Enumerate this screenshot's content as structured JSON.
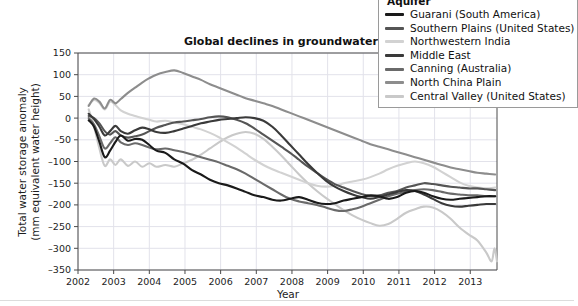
{
  "chart_data": {
    "type": "line",
    "title": "Global declines in groundwater",
    "xlabel": "Year",
    "ylabel_line1": "Total water storage anomaly",
    "ylabel_line2": "(mm equivalent water height)",
    "xlim": [
      2002.0,
      2013.75
    ],
    "ylim": [
      -350,
      150
    ],
    "ytick_step": 50,
    "yticks": [
      150,
      100,
      50,
      0,
      -50,
      -100,
      -150,
      -200,
      -250,
      -300,
      -350
    ],
    "xticks": [
      2002,
      2003,
      2004,
      2005,
      2006,
      2007,
      2008,
      2009,
      2010,
      2011,
      2012,
      2013
    ],
    "grid": true,
    "legend_position": "top-right",
    "legend_title": "Aquifer",
    "series": [
      {
        "name": "Guarani (South America)",
        "color": "#1a1a1a",
        "x": [
          2002.3,
          2002.45,
          2002.6,
          2002.75,
          2002.9,
          2003.05,
          2003.2,
          2003.4,
          2003.6,
          2003.8,
          2004.0,
          2004.2,
          2004.45,
          2004.7,
          2004.95,
          2005.2,
          2005.45,
          2005.7,
          2005.95,
          2006.2,
          2006.45,
          2006.7,
          2006.95,
          2007.2,
          2007.45,
          2007.7,
          2007.95,
          2008.2,
          2008.45,
          2008.7,
          2008.95,
          2009.2,
          2009.45,
          2009.7,
          2009.95,
          2010.2,
          2010.45,
          2010.7,
          2010.95,
          2011.2,
          2011.45,
          2011.7,
          2011.95,
          2012.2,
          2012.45,
          2012.7,
          2012.95,
          2013.2,
          2013.45,
          2013.7
        ],
        "y": [
          -5,
          -20,
          -55,
          -90,
          -75,
          -55,
          -40,
          -52,
          -48,
          -50,
          -62,
          -75,
          -80,
          -95,
          -105,
          -120,
          -130,
          -142,
          -150,
          -155,
          -162,
          -170,
          -178,
          -182,
          -188,
          -190,
          -186,
          -182,
          -188,
          -195,
          -198,
          -196,
          -190,
          -186,
          -182,
          -178,
          -180,
          -186,
          -182,
          -172,
          -168,
          -172,
          -180,
          -186,
          -188,
          -186,
          -184,
          -182,
          -180,
          -180
        ]
      },
      {
        "name": "Southern Plains (United States)",
        "color": "#555555",
        "x": [
          2002.3,
          2002.45,
          2002.6,
          2002.75,
          2002.9,
          2003.05,
          2003.2,
          2003.4,
          2003.6,
          2003.8,
          2004.0,
          2004.2,
          2004.45,
          2004.7,
          2004.95,
          2005.2,
          2005.45,
          2005.7,
          2005.95,
          2006.2,
          2006.45,
          2006.7,
          2006.95,
          2007.2,
          2007.45,
          2007.7,
          2007.95,
          2008.2,
          2008.45,
          2008.7,
          2008.95,
          2009.2,
          2009.45,
          2009.7,
          2009.95,
          2010.2,
          2010.45,
          2010.7,
          2010.95,
          2011.2,
          2011.45,
          2011.7,
          2011.95,
          2012.2,
          2012.45,
          2012.7,
          2012.95,
          2013.2,
          2013.45,
          2013.7
        ],
        "y": [
          5,
          0,
          -12,
          -30,
          -38,
          -30,
          -40,
          -45,
          -42,
          -38,
          -30,
          -22,
          -16,
          -10,
          -8,
          -5,
          -2,
          2,
          4,
          2,
          -4,
          -12,
          -24,
          -38,
          -52,
          -66,
          -80,
          -96,
          -112,
          -126,
          -140,
          -152,
          -160,
          -168,
          -175,
          -180,
          -178,
          -172,
          -168,
          -160,
          -155,
          -150,
          -152,
          -155,
          -158,
          -160,
          -162,
          -162,
          -164,
          -166
        ]
      },
      {
        "name": "Northwestern India",
        "color": "#d2d2d2",
        "x": [
          2002.3,
          2002.45,
          2002.6,
          2002.75,
          2002.9,
          2003.05,
          2003.2,
          2003.4,
          2003.6,
          2003.8,
          2004.0,
          2004.2,
          2004.45,
          2004.7,
          2004.95,
          2005.2,
          2005.45,
          2005.7,
          2005.95,
          2006.2,
          2006.45,
          2006.7,
          2006.95,
          2007.2,
          2007.45,
          2007.7,
          2007.95,
          2008.2,
          2008.45,
          2008.7,
          2008.95,
          2009.2,
          2009.45,
          2009.7,
          2009.95,
          2010.2,
          2010.45,
          2010.7,
          2010.95,
          2011.2,
          2011.45,
          2011.7,
          2011.95,
          2012.2,
          2012.45,
          2012.7,
          2012.95,
          2013.2,
          2013.45,
          2013.7
        ],
        "y": [
          30,
          42,
          35,
          20,
          38,
          30,
          18,
          10,
          5,
          0,
          -4,
          -8,
          -6,
          -10,
          -14,
          -20,
          -26,
          -34,
          -44,
          -56,
          -68,
          -82,
          -96,
          -108,
          -118,
          -126,
          -134,
          -142,
          -150,
          -156,
          -158,
          -156,
          -150,
          -146,
          -142,
          -136,
          -128,
          -118,
          -110,
          -104,
          -100,
          -104,
          -112,
          -124,
          -136,
          -148,
          -156,
          -160,
          -162,
          -160
        ]
      },
      {
        "name": "Middle East",
        "color": "#3a3a3a",
        "x": [
          2002.3,
          2002.45,
          2002.6,
          2002.75,
          2002.9,
          2003.05,
          2003.2,
          2003.4,
          2003.6,
          2003.8,
          2004.0,
          2004.2,
          2004.45,
          2004.7,
          2004.95,
          2005.2,
          2005.45,
          2005.7,
          2005.95,
          2006.2,
          2006.45,
          2006.7,
          2006.95,
          2007.2,
          2007.45,
          2007.7,
          2007.95,
          2008.2,
          2008.45,
          2008.7,
          2008.95,
          2009.2,
          2009.45,
          2009.7,
          2009.95,
          2010.2,
          2010.45,
          2010.7,
          2010.95,
          2011.2,
          2011.45,
          2011.7,
          2011.95,
          2012.2,
          2012.45,
          2012.7,
          2012.95,
          2013.2,
          2013.45,
          2013.7
        ],
        "y": [
          10,
          -2,
          -20,
          -40,
          -30,
          -18,
          -30,
          -36,
          -28,
          -22,
          -26,
          -32,
          -34,
          -30,
          -24,
          -18,
          -12,
          -8,
          -4,
          -2,
          0,
          2,
          0,
          -6,
          -20,
          -40,
          -62,
          -84,
          -106,
          -126,
          -144,
          -158,
          -168,
          -176,
          -182,
          -186,
          -182,
          -176,
          -170,
          -166,
          -168,
          -176,
          -186,
          -196,
          -202,
          -204,
          -202,
          -200,
          -198,
          -198
        ]
      },
      {
        "name": "Canning (Australia)",
        "color": "#6a6a6a",
        "x": [
          2002.3,
          2002.45,
          2002.6,
          2002.75,
          2002.9,
          2003.05,
          2003.2,
          2003.4,
          2003.6,
          2003.8,
          2004.0,
          2004.2,
          2004.45,
          2004.7,
          2004.95,
          2005.2,
          2005.45,
          2005.7,
          2005.95,
          2006.2,
          2006.45,
          2006.7,
          2006.95,
          2007.2,
          2007.45,
          2007.7,
          2007.95,
          2008.2,
          2008.45,
          2008.7,
          2008.95,
          2009.2,
          2009.45,
          2009.7,
          2009.95,
          2010.2,
          2010.45,
          2010.7,
          2010.95,
          2011.2,
          2011.45,
          2011.7,
          2011.95,
          2012.2,
          2012.45,
          2012.7,
          2012.95,
          2013.2,
          2013.45,
          2013.7
        ],
        "y": [
          0,
          -15,
          -42,
          -70,
          -58,
          -44,
          -56,
          -62,
          -58,
          -62,
          -68,
          -72,
          -70,
          -74,
          -78,
          -84,
          -90,
          -96,
          -102,
          -110,
          -118,
          -128,
          -140,
          -152,
          -164,
          -176,
          -186,
          -192,
          -196,
          -200,
          -206,
          -212,
          -214,
          -210,
          -204,
          -196,
          -188,
          -180,
          -174,
          -170,
          -166,
          -164,
          -166,
          -170,
          -174,
          -176,
          -178,
          -178,
          -180,
          -180
        ]
      },
      {
        "name": "North China Plain",
        "color": "#8d8d8d",
        "x": [
          2002.3,
          2002.45,
          2002.6,
          2002.75,
          2002.9,
          2003.05,
          2003.2,
          2003.4,
          2003.6,
          2003.8,
          2004.0,
          2004.2,
          2004.45,
          2004.7,
          2004.95,
          2005.2,
          2005.45,
          2005.7,
          2005.95,
          2006.2,
          2006.45,
          2006.7,
          2006.95,
          2007.2,
          2007.45,
          2007.7,
          2007.95,
          2008.2,
          2008.45,
          2008.7,
          2008.95,
          2009.2,
          2009.45,
          2009.7,
          2009.95,
          2010.2,
          2010.45,
          2010.7,
          2010.95,
          2011.2,
          2011.45,
          2011.7,
          2011.95,
          2012.2,
          2012.45,
          2012.7,
          2012.95,
          2013.2,
          2013.45,
          2013.7
        ],
        "y": [
          28,
          45,
          38,
          22,
          42,
          34,
          44,
          58,
          70,
          82,
          92,
          100,
          106,
          110,
          104,
          96,
          88,
          78,
          70,
          62,
          54,
          46,
          40,
          34,
          28,
          20,
          12,
          4,
          -4,
          -12,
          -20,
          -28,
          -36,
          -44,
          -52,
          -60,
          -66,
          -72,
          -78,
          -84,
          -90,
          -96,
          -102,
          -108,
          -114,
          -118,
          -122,
          -126,
          -128,
          -130
        ]
      },
      {
        "name": "Central Valley (United States)",
        "color": "#c9c9c9",
        "x": [
          2002.3,
          2002.45,
          2002.6,
          2002.75,
          2002.9,
          2003.05,
          2003.2,
          2003.4,
          2003.6,
          2003.8,
          2004.0,
          2004.2,
          2004.45,
          2004.7,
          2004.95,
          2005.2,
          2005.45,
          2005.7,
          2005.95,
          2006.2,
          2006.45,
          2006.7,
          2006.95,
          2007.2,
          2007.45,
          2007.7,
          2007.95,
          2008.2,
          2008.45,
          2008.7,
          2008.95,
          2009.2,
          2009.45,
          2009.7,
          2009.95,
          2010.2,
          2010.45,
          2010.7,
          2010.95,
          2011.2,
          2011.45,
          2011.7,
          2011.95,
          2012.2,
          2012.45,
          2012.7,
          2012.95,
          2013.2,
          2013.45,
          2013.6,
          2013.68,
          2013.75
        ],
        "y": [
          20,
          -20,
          -70,
          -110,
          -95,
          -108,
          -95,
          -110,
          -100,
          -112,
          -104,
          -112,
          -108,
          -112,
          -104,
          -96,
          -84,
          -70,
          -56,
          -44,
          -36,
          -32,
          -36,
          -48,
          -66,
          -86,
          -108,
          -130,
          -150,
          -168,
          -184,
          -198,
          -212,
          -224,
          -234,
          -242,
          -248,
          -244,
          -232,
          -218,
          -210,
          -204,
          -206,
          -216,
          -232,
          -252,
          -268,
          -282,
          -310,
          -330,
          -300,
          -330
        ]
      }
    ]
  },
  "legend": {
    "title": "Aquifer",
    "items": [
      {
        "label": "Guarani (South America)",
        "color": "#1a1a1a"
      },
      {
        "label": "Southern Plains (United States)",
        "color": "#555555"
      },
      {
        "label": "Northwestern India",
        "color": "#d2d2d2"
      },
      {
        "label": "Middle East",
        "color": "#3a3a3a"
      },
      {
        "label": "Canning (Australia)",
        "color": "#6a6a6a"
      },
      {
        "label": "North China Plain",
        "color": "#8d8d8d"
      },
      {
        "label": "Central Valley (United States)",
        "color": "#c9c9c9"
      }
    ]
  }
}
